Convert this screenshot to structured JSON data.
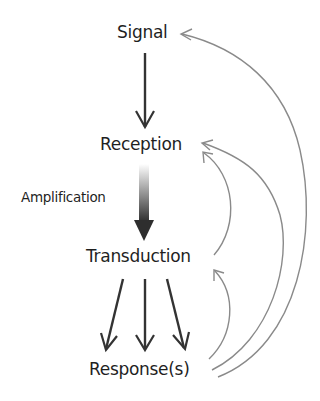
{
  "diagram": {
    "nodes": {
      "signal": "Signal",
      "reception": "Reception",
      "transduction": "Transduction",
      "response": "Response(s)"
    },
    "edge_labels": {
      "amplification": "Amplification"
    },
    "edges": [
      {
        "from": "Signal",
        "to": "Reception",
        "style": "solid-dark"
      },
      {
        "from": "Reception",
        "to": "Transduction",
        "style": "thick-gradient",
        "label": "Amplification"
      },
      {
        "from": "Transduction",
        "to": "Response(s)",
        "style": "solid-dark",
        "count": 3
      },
      {
        "from": "Response(s)",
        "to": "Signal",
        "style": "curved-gray-feedback"
      },
      {
        "from": "Response(s)",
        "to": "Reception",
        "style": "curved-gray-feedback"
      },
      {
        "from": "Transduction",
        "to": "Reception",
        "style": "curved-gray-feedback"
      },
      {
        "from": "Response(s)",
        "to": "Transduction",
        "style": "curved-gray-feedback"
      }
    ],
    "colors": {
      "main_arrow": "#333333",
      "feedback_arrow": "#8a8a8a",
      "text": "#1f1f1f",
      "background": "#ffffff"
    }
  }
}
